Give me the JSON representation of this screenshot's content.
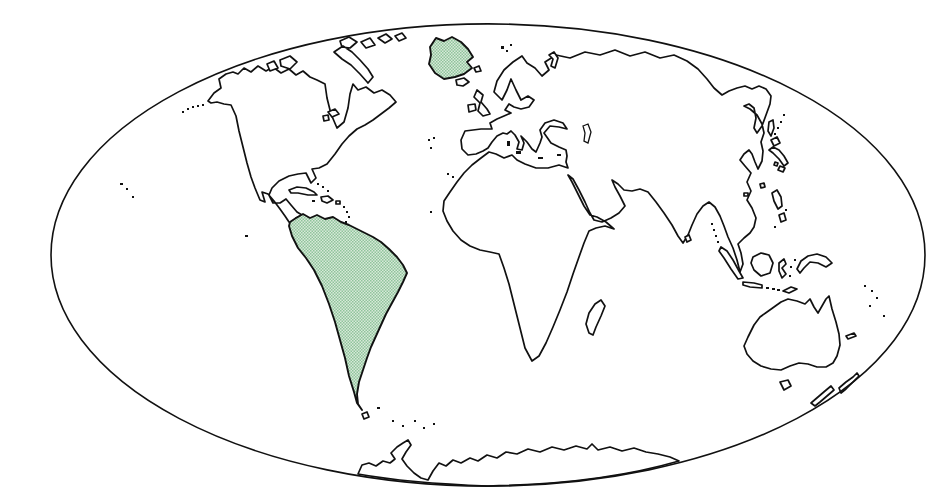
{
  "map": {
    "type": "world-outline-map",
    "projection_shape": "ellipse",
    "highlighted_regions": [
      "Greenland",
      "South America"
    ],
    "colors": {
      "background": "#ffffff",
      "outline": "#111111",
      "land_fill": "#ffffff",
      "highlight_base": "#d8e9d9",
      "highlight_dot": "#8fc49b"
    },
    "paths": {
      "globe": "M 11 239 A 437 231 0 1 1 885 239 A 437 231 0 1 1 11 239 Z",
      "antarctica": "M 318 458 L 322 449 L 329 447 L 336 450 L 343 445 L 350 447 L 355 443 L 351 437 L 357 431 L 363 427 L 368 424 L 371 429 L 366 436 L 362 443 L 367 450 L 374 457 L 381 462 L 388 464 L 393 455 L 399 447 L 406 450 L 413 444 L 421 447 L 430 442 L 438 445 L 447 439 L 457 442 L 466 436 L 477 438 L 488 433 L 500 436 L 512 431 L 524 434 L 536 430 L 547 433 L 552 428 L 558 434 L 570 431 L 582 435 L 594 432 L 606 436 L 618 438 L 630 441 L 639 445 Q 560 468 448 470 Q 368 467 318 458 Z",
      "afro_eurasia": "M 482 40 L 473 46 L 464 54 L 457 65 L 454 76 L 462 84 L 467 74 L 471 63 L 476 74 L 481 84 L 488 80 L 494 84 L 489 91 L 481 93 L 474 91 L 469 88 L 465 94 L 471 97 L 464 100 L 457 103 L 450 107 L 452 113 L 441 113 L 425 115 L 421 124 L 422 133 L 428 139 L 436 138 L 443 135 L 448 132 L 452 126 L 457 120 L 463 117 L 467 118 L 471 115 L 475 119 L 479 126 L 477 133 L 482 134 L 484 127 L 481 120 L 487 126 L 492 133 L 496 136 L 500 127 L 502 121 L 500 114 L 505 107 L 514 104 L 523 107 L 527 113 L 519 111 L 510 110 L 504 117 L 511 127 L 519 131 L 526 134 L 527 140 L 526 146 L 528 152 L 519 149 L 508 152 L 496 152 L 485 148 L 477 144 L 472 139 L 464 142 L 456 138 L 449 136 L 441 142 L 432 149 L 424 157 L 417 166 L 410 176 L 404 185 L 403 195 L 407 205 L 413 215 L 421 224 L 430 230 L 440 234 L 450 236 L 459 238 L 464 252 L 469 268 L 473 284 L 477 300 L 481 316 L 485 332 L 492 345 L 499 340 L 506 327 L 513 311 L 520 294 L 527 276 L 533 258 L 539 241 L 544 227 L 549 215 L 556 212 L 565 210 L 574 213 L 566 206 L 557 201 L 550 199 L 544 190 L 538 178 L 532 166 L 528 159 L 533 163 L 539 174 L 545 186 L 550 197 L 554 204 L 562 206 L 571 202 L 579 197 L 585 190 L 580 180 L 575 171 L 572 164 L 578 168 L 584 174 L 592 175 L 600 173 L 608 176 L 616 186 L 624 197 L 632 209 L 638 220 L 643 227 L 648 219 L 652 209 L 657 198 L 663 190 L 669 186 L 675 191 L 680 200 L 684 210 L 688 221 L 693 232 L 697 244 L 700 256 L 703 248 L 701 237 L 698 228 L 704 222 L 710 217 L 714 211 L 716 202 L 712 192 L 707 184 L 711 175 L 707 166 L 711 157 L 705 150 L 700 144 L 704 138 L 709 134 L 712 138 L 715 146 L 718 153 L 722 145 L 723 135 L 721 126 L 724 117 L 722 108 L 717 99 L 710 93 L 704 90 L 709 88 L 714 92 L 716 102 L 714 112 L 717 117 L 722 110 L 726 99 L 730 88 L 731 80 L 726 73 L 719 70 L 712 73 L 705 70 L 697 72 L 689 75 L 682 79 L 674 72 L 667 63 L 658 53 L 647 45 L 634 39 L 620 42 L 605 36 L 590 40 L 575 34 L 560 39 L 545 36 L 530 42 L 516 39 L 505 46 L 509 54 L 502 60 L 495 52 L 487 47 Z",
      "north_america": "M 168 85 L 174 77 L 181 72 L 179 63 L 186 58 L 193 56 L 198 58 L 204 52 L 211 56 L 218 50 L 226 55 L 233 51 L 241 57 L 249 53 L 256 59 L 263 55 L 270 61 L 277 64 L 285 68 L 287 82 L 291 98 L 297 112 L 304 106 L 308 92 L 310 78 L 313 68 L 318 74 L 326 71 L 334 77 L 342 74 L 350 79 L 356 86 L 349 92 L 341 98 L 333 104 L 325 109 L 317 113 L 309 120 L 302 128 L 295 138 L 287 148 L 279 152 L 272 153 L 276 162 L 271 167 L 266 157 L 258 158 L 249 160 L 239 165 L 232 172 L 229 179 L 233 187 L 240 187 L 246 183 L 251 189 L 257 196 L 262 199 L 256 202 L 259 207 L 253 210 L 249 206 L 245 200 L 240 193 L 234 185 L 228 178 L 222 176 L 225 186 L 220 184 L 215 172 L 211 161 L 207 147 L 203 131 L 199 115 L 196 100 L 191 89 L 184 88 L 177 86 L 171 87 Z",
      "arctic_islands": "M 240 44 L 250 40 L 257 46 L 250 53 L 241 50 Z M 227 48 L 234 45 L 238 52 L 230 55 Z M 294 36 L 303 30 L 312 36 L 320 44 L 328 53 L 333 61 L 328 67 L 320 58 L 311 49 L 302 43 Z M 300 25 L 309 21 L 317 26 L 310 32 L 302 31 Z M 321 26 L 330 22 L 335 29 L 326 32 Z M 338 22 L 346 18 L 352 23 L 345 27 Z M 355 20 L 362 17 L 366 22 L 359 25 Z M 288 96 L 295 93 L 299 98 L 292 101 Z M 283 100 L 288 99 L 289 104 L 284 105 Z",
      "greenland": "M 390 31 L 396 22 L 404 25 L 412 21 L 421 26 L 428 33 L 433 41 L 427 46 L 432 52 L 424 58 L 415 61 L 404 63 L 395 57 L 389 48 L 391 39 Z",
      "greenland_islet": "M 434 52 L 439 50 L 441 55 L 436 56 Z",
      "iceland": "M 416 64 L 424 62 L 429 66 L 423 70 L 417 69 Z",
      "british_isles": "M 437 74 L 443 79 L 441 86 L 447 93 L 450 98 L 443 100 L 438 95 L 440 87 L 434 81 Z M 428 89 L 435 88 L 436 94 L 429 96 Z",
      "novaya_zemlya": "M 509 39 L 514 36 L 518 42 L 515 52 L 511 50 L 513 43 Z",
      "south_america": "M 250 206 L 256 202 L 263 198 L 270 202 L 277 199 L 285 203 L 293 201 L 301 206 L 309 209 L 317 213 L 325 217 L 333 221 L 341 226 L 349 233 L 357 241 L 363 249 L 367 257 L 363 266 L 358 276 L 352 287 L 346 298 L 341 309 L 336 320 L 331 331 L 327 342 L 323 354 L 319 366 L 317 378 L 318 388 L 322 394 L 317 387 L 314 376 L 309 360 L 305 342 L 300 324 L 295 306 L 289 288 L 282 270 L 274 254 L 266 242 L 258 232 L 252 220 L 249 210 Z",
      "tierra_del_fuego": "M 322 398 L 327 396 L 329 401 L 324 403 Z",
      "caribbean_islands": "M 249 174 L 257 171 L 266 172 L 274 176 L 277 179 L 268 179 L 258 177 L 251 177 Z M 281 181 L 288 180 L 293 184 L 287 187 L 282 185 Z M 296 185 L 300 185 L 300 188 L 296 188 Z",
      "madagascar": "M 549 317 L 546 308 L 549 297 L 555 288 L 561 284 L 565 290 L 561 300 L 556 311 L 553 319 Z",
      "sri_lanka": "M 645 221 L 649 219 L 651 224 L 647 226 Z",
      "japan": "M 731 124 L 737 121 L 740 127 L 734 130 Z M 733 131 L 739 134 L 744 140 L 748 147 L 744 150 L 739 143 L 733 137 L 729 134 Z M 740 150 L 745 152 L 743 156 L 738 154 Z M 735 146 L 738 147 L 737 150 L 734 149 Z",
      "sakhalin": "M 729 106 L 733 104 L 734 112 L 731 120 L 728 115 Z",
      "taiwan_hainan": "M 720 168 L 724 167 L 725 171 L 721 172 Z M 704 177 L 708 177 L 708 180 L 704 180 Z",
      "philippines": "M 732 177 L 737 174 L 741 181 L 742 190 L 738 193 L 734 185 Z M 739 199 L 744 197 L 746 204 L 741 206 Z",
      "indonesia": "M 681 231 L 687 235 L 693 244 L 699 255 L 703 262 L 698 263 L 691 253 L 684 242 L 679 235 Z M 703 266 L 714 267 L 722 269 L 722 272 L 710 271 L 703 269 Z M 713 241 L 721 237 L 729 239 L 733 247 L 730 257 L 721 260 L 714 254 L 711 247 Z M 739 247 L 744 243 L 746 248 L 742 252 L 746 258 L 742 262 L 739 255 Z M 743 275 L 751 271 L 757 273 L 749 277 Z",
      "new_guinea": "M 757 253 L 761 245 L 768 240 L 777 238 L 786 241 L 792 247 L 786 251 L 778 247 L 770 246 L 764 252 L 760 257 Z",
      "australia": "M 748 283 L 757 285 L 765 288 L 770 283 L 774 291 L 778 297 L 782 290 L 786 283 L 789 280 L 792 293 L 796 306 L 799 318 L 800 329 L 797 340 L 793 347 L 786 351 L 777 351 L 768 348 L 759 347 L 750 350 L 741 354 L 731 353 L 721 350 L 713 345 L 707 338 L 704 330 L 708 321 L 714 309 L 720 301 L 727 296 L 734 291 L 741 286 Z",
      "tasmania": "M 740 366 L 748 364 L 751 370 L 744 374 Z",
      "new_zealand": "M 799 372 L 806 366 L 813 361 L 817 357 L 819 360 L 812 367 L 806 373 L 801 377 Z M 771 387 L 778 381 L 785 375 L 791 370 L 794 374 L 787 380 L 780 386 L 775 390 Z",
      "new_caledonia": "M 806 320 L 814 317 L 816 320 L 808 323 Z",
      "caspian_sea": "M 543 110 L 548 108 L 551 116 L 548 127 L 544 125 L 545 117 Z",
      "dots_aleutian": "M 142 95 h2 v2 h-2 Z M 147 92 h2 v2 h-2 Z M 152 90 h2 v2 h-2 Z M 157 89 h2 v2 h-2 Z M 162 88 h2 v2 h-2 Z",
      "dots_pacific": "M 80 167 h3 v2 h-3 Z M 86 172 h2 v2 h-2 Z M 92 180 h2 v2 h-2 Z M 205 219 h3 v2 h-3 Z",
      "dots_atlantic": "M 388 123 h2 v2 h-2 Z M 393 121 h2 v2 h-2 Z M 390 131 h2 v2 h-2 Z M 407 157 h2 v2 h-2 Z M 412 160 h2 v2 h-2 Z M 390 195 h2 v2 h-2 Z",
      "dots_caribbean": "M 272 184 h3 v2 h-3 Z M 303 190 h2 v2 h-2 Z M 306 195 h2 v2 h-2 Z M 308 200 h2 v2 h-2 Z M 305 205 h2 v2 h-2 Z M 277 167 h2 v2 h-2 Z M 282 170 h2 v2 h-2 Z M 287 174 h2 v2 h-2 Z",
      "dots_south_atlantic": "M 337 391 h3 v2 h-3 Z M 352 404 h2 v2 h-2 Z M 362 409 h2 v2 h-2 Z M 374 404 h2 v2 h-2 Z M 383 411 h2 v2 h-2 Z M 393 407 h2 v2 h-2 Z",
      "dots_arctic": "M 461 30 h3 v3 h-3 Z M 466 34 h2 v2 h-2 Z M 470 28 h2 v2 h-2 Z",
      "dots_asia": "M 734 117 h2 v2 h-2 Z M 737 111 h2 v2 h-2 Z M 740 105 h2 v2 h-2 Z M 743 98 h2 v2 h-2 Z M 671 207 h2 v2 h-2 Z M 673 213 h2 v2 h-2 Z M 675 219 h2 v2 h-2 Z M 677 225 h2 v2 h-2 Z M 745 193 h2 v2 h-2 Z M 734 210 h2 v2 h-2 Z M 726 271 h3 v2 h-3 Z M 732 272 h3 v2 h-3 Z M 737 273 h3 v2 h-3 Z M 750 250 h2 v2 h-2 Z M 754 243 h2 v2 h-2 Z M 749 259 h2 v2 h-2 Z",
      "dots_melanesia": "M 824 269 h2 v2 h-2 Z M 831 274 h2 v2 h-2 Z M 836 281 h2 v2 h-2 Z M 829 289 h2 v2 h-2 Z M 843 299 h2 v2 h-2 Z",
      "dots_mediterranean": "M 476 135 h5 v3 h-5 Z M 467 125 h3 v5 h-3 Z M 498 141 h5 v2 h-5 Z M 517 138 h4 v2 h-4 Z"
    }
  }
}
